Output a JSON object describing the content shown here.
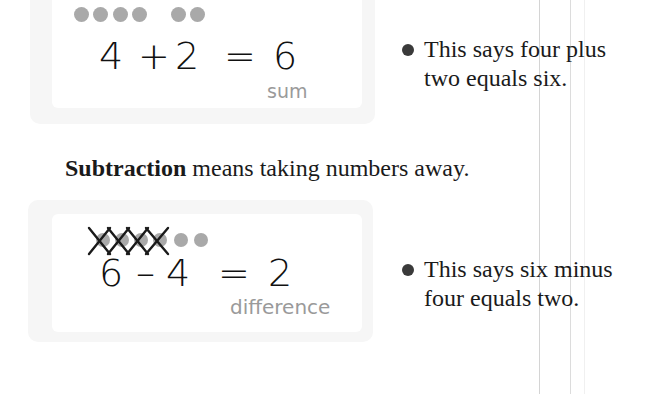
{
  "colors": {
    "dot": "#a9a9a9",
    "label": "#9a9a9a",
    "text": "#1a1a1a",
    "box_border": "#f6f6f6"
  },
  "addition": {
    "dots_group1": 4,
    "dots_group2": 2,
    "equation": {
      "a": "4",
      "op": "+",
      "b": "2",
      "eq": "=",
      "result": "6"
    },
    "result_label": "sum",
    "bullet": [
      "This says four plus",
      "two equals six."
    ]
  },
  "subtraction": {
    "intro_bold": "Subtraction",
    "intro_rest": " means taking numbers away.",
    "crossed_dots": 4,
    "remaining_dots": 2,
    "equation": {
      "a": "6",
      "op": "–",
      "b": "4",
      "eq": "=",
      "result": "2"
    },
    "result_label": "difference",
    "bullet": [
      "This says six minus",
      "four equals two."
    ]
  }
}
